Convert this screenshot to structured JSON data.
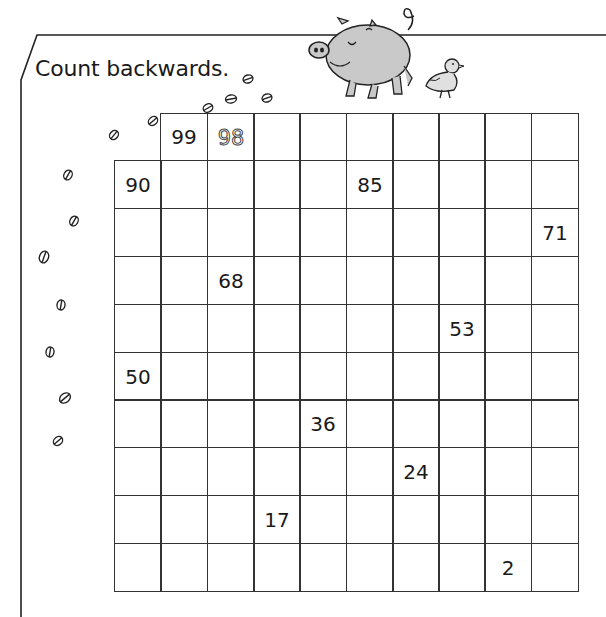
{
  "worksheet": {
    "instruction": "Count backwards.",
    "grid": {
      "columns": 10,
      "rows": 10,
      "start": 100,
      "end": 1,
      "first_row_blank_cells": 1,
      "given_numbers": [
        {
          "row": 0,
          "col": 1,
          "value": "99"
        },
        {
          "row": 0,
          "col": 2,
          "value": "98",
          "style": "dotted-trace"
        },
        {
          "row": 1,
          "col": 0,
          "value": "90"
        },
        {
          "row": 1,
          "col": 5,
          "value": "85"
        },
        {
          "row": 2,
          "col": 9,
          "value": "71"
        },
        {
          "row": 3,
          "col": 2,
          "value": "68"
        },
        {
          "row": 4,
          "col": 7,
          "value": "53"
        },
        {
          "row": 5,
          "col": 0,
          "value": "50"
        },
        {
          "row": 6,
          "col": 4,
          "value": "36"
        },
        {
          "row": 7,
          "col": 6,
          "value": "24"
        },
        {
          "row": 8,
          "col": 3,
          "value": "17"
        },
        {
          "row": 9,
          "col": 8,
          "value": "2"
        }
      ]
    },
    "illustrations": [
      "pig-icon",
      "chick-icon",
      "hoofprint-trail-icon"
    ]
  },
  "colors": {
    "ink": "#1a1a1a",
    "grid": "#333333",
    "pig": "#c9c9c9",
    "chick": "#e0e0e0"
  }
}
